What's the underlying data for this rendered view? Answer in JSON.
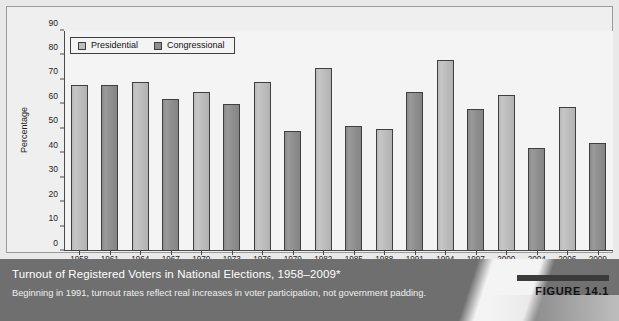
{
  "figure": {
    "number_label": "FIGURE 14.1",
    "caption_title": "Turnout of Registered Voters in National Elections, 1958–2009*",
    "caption_note": "Beginning in 1991, turnout rates reflect real increases in voter participation, not government padding."
  },
  "colors": {
    "presidential": "#bdbdbd",
    "congressional": "#8f8f8f",
    "caption_bar": "#6f6f6f",
    "panel_background": "#e9e9e9",
    "plot_background": "#f4f4f4",
    "axis": "#4a4a4a"
  },
  "chart_data": {
    "type": "bar",
    "title": "Turnout of Registered Voters in National Elections, 1958–2009*",
    "xlabel": "",
    "ylabel": "Percentage",
    "ylim": [
      0,
      90
    ],
    "yticks": [
      0,
      10,
      20,
      30,
      40,
      50,
      60,
      70,
      80,
      90
    ],
    "grid": false,
    "legend_position": "top-left",
    "categories": [
      "1958",
      "1961",
      "1964",
      "1967",
      "1970",
      "1973",
      "1976",
      "1979",
      "1982",
      "1985",
      "1988",
      "1991",
      "1994",
      "1997",
      "2000",
      "2004",
      "2006",
      "2009"
    ],
    "values": [
      68,
      68,
      69,
      62,
      65,
      60,
      69,
      49,
      75,
      51,
      50,
      65,
      78,
      58,
      64,
      42,
      59,
      44
    ],
    "series_of_bar": [
      "Congressional",
      "Presidential",
      "Congressional",
      "Presidential",
      "Congressional",
      "Presidential",
      "Congressional",
      "Presidential",
      "Congressional",
      "Presidential",
      "Congressional",
      "Presidential",
      "Congressional",
      "Presidential",
      "Congressional",
      "Presidential",
      "Congressional",
      "Presidential"
    ],
    "bars": [
      {
        "year": "1958",
        "value": 68,
        "series": "Presidential"
      },
      {
        "year": "1961",
        "value": 68,
        "series": "Congressional"
      },
      {
        "year": "1964",
        "value": 69,
        "series": "Presidential"
      },
      {
        "year": "1967",
        "value": 62,
        "series": "Congressional"
      },
      {
        "year": "1970",
        "value": 65,
        "series": "Presidential"
      },
      {
        "year": "1973",
        "value": 60,
        "series": "Congressional"
      },
      {
        "year": "1976",
        "value": 69,
        "series": "Presidential"
      },
      {
        "year": "1979",
        "value": 49,
        "series": "Congressional"
      },
      {
        "year": "1982",
        "value": 75,
        "series": "Presidential"
      },
      {
        "year": "1985",
        "value": 51,
        "series": "Congressional"
      },
      {
        "year": "1988",
        "value": 50,
        "series": "Presidential"
      },
      {
        "year": "1991",
        "value": 65,
        "series": "Congressional"
      },
      {
        "year": "1994",
        "value": 78,
        "series": "Presidential"
      },
      {
        "year": "1997",
        "value": 58,
        "series": "Congressional"
      },
      {
        "year": "2000",
        "value": 64,
        "series": "Presidential"
      },
      {
        "year": "2004",
        "value": 42,
        "series": "Congressional"
      },
      {
        "year": "2006",
        "value": 59,
        "series": "Presidential"
      },
      {
        "year": "2009",
        "value": 44,
        "series": "Congressional"
      }
    ],
    "legend": [
      {
        "label": "Presidential",
        "color": "#bdbdbd"
      },
      {
        "label": "Congressional",
        "color": "#8f8f8f"
      }
    ]
  }
}
